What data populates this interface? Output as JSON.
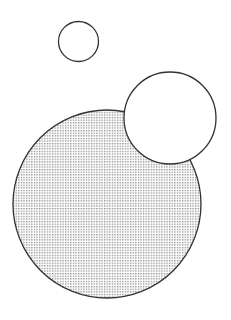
{
  "diagram": {
    "width": 231,
    "height": 320,
    "background": "#ffffff",
    "stroke_color": "#333333",
    "dot_color": "#8a8a8a",
    "circles": [
      {
        "id": "small",
        "cx": 78.5,
        "cy": 41.5,
        "r": 20,
        "fill": "none"
      },
      {
        "id": "large",
        "cx": 107,
        "cy": 204,
        "r": 94,
        "fill": "dotted"
      },
      {
        "id": "medium",
        "cx": 170,
        "cy": 118,
        "r": 46,
        "fill": "white"
      }
    ]
  }
}
